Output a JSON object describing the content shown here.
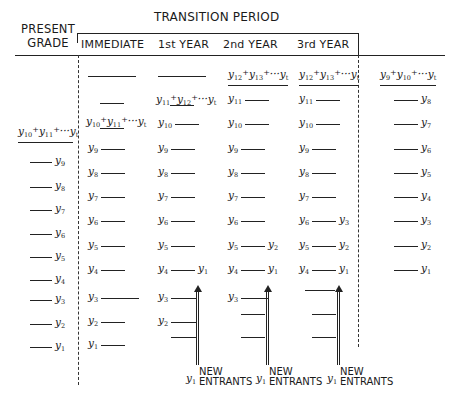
{
  "header": {
    "present_grade_line1": "PRESENT",
    "present_grade_line2": "GRADE",
    "transition_period": "TRANSITION PERIOD",
    "columns": [
      "IMMEDIATE",
      "1st YEAR",
      "2nd YEAR",
      "3rd YEAR"
    ]
  },
  "present_grade": {
    "sum_label": "y10+y11+···yt",
    "items": [
      "y9",
      "y8",
      "y7",
      "y6",
      "y5",
      "y4",
      "y3",
      "y2",
      "y1"
    ]
  },
  "immediate": {
    "sum_label": "y10+y11+···yt",
    "items": [
      "y9",
      "y8",
      "y7",
      "y6",
      "y5",
      "y4",
      "y3",
      "y2",
      "y1"
    ]
  },
  "year1": {
    "sum_label": "y11+y12+···yt",
    "items": [
      {
        "left": "y10",
        "right": ""
      },
      {
        "left": "y9",
        "right": ""
      },
      {
        "left": "y8",
        "right": ""
      },
      {
        "left": "y7",
        "right": ""
      },
      {
        "left": "y6",
        "right": ""
      },
      {
        "left": "y5",
        "right": ""
      },
      {
        "left": "y4",
        "right": "y1"
      },
      {
        "left": "y3",
        "right": ""
      },
      {
        "left": "y2",
        "right": ""
      },
      {
        "left": "",
        "right": ""
      }
    ],
    "new_entrants_symbol": "y1",
    "new_entrants_line1": "NEW",
    "new_entrants_line2": "ENTRANTS"
  },
  "year2": {
    "sum_label": "y12+y13+···yt",
    "items": [
      {
        "left": "y11",
        "right": ""
      },
      {
        "left": "y10",
        "right": ""
      },
      {
        "left": "y9",
        "right": ""
      },
      {
        "left": "y8",
        "right": ""
      },
      {
        "left": "y7",
        "right": ""
      },
      {
        "left": "y6",
        "right": ""
      },
      {
        "left": "y5",
        "right": "y2"
      },
      {
        "left": "y4",
        "right": "y1"
      },
      {
        "left": "y3",
        "right": ""
      },
      {
        "left": "",
        "right": ""
      },
      {
        "left": "",
        "right": ""
      }
    ],
    "new_entrants_symbol": "y1",
    "new_entrants_line1": "NEW",
    "new_entrants_line2": "ENTRANTS"
  },
  "year3": {
    "sum_label": "y12+y13+···yt",
    "items": [
      {
        "left": "y11",
        "right": ""
      },
      {
        "left": "y10",
        "right": ""
      },
      {
        "left": "y9",
        "right": ""
      },
      {
        "left": "y8",
        "right": ""
      },
      {
        "left": "y7",
        "right": ""
      },
      {
        "left": "y6",
        "right": "y3"
      },
      {
        "left": "y5",
        "right": "y2"
      },
      {
        "left": "y4",
        "right": "y1"
      },
      {
        "left": "",
        "right": ""
      },
      {
        "left": "",
        "right": ""
      },
      {
        "left": "",
        "right": ""
      }
    ],
    "new_entrants_symbol": "y1",
    "new_entrants_line1": "NEW",
    "new_entrants_line2": "ENTRANTS"
  },
  "final": {
    "sum_label": "y9+y10+···yt",
    "items": [
      "y8",
      "y7",
      "y6",
      "y5",
      "y4",
      "y3",
      "y2",
      "y1"
    ]
  }
}
